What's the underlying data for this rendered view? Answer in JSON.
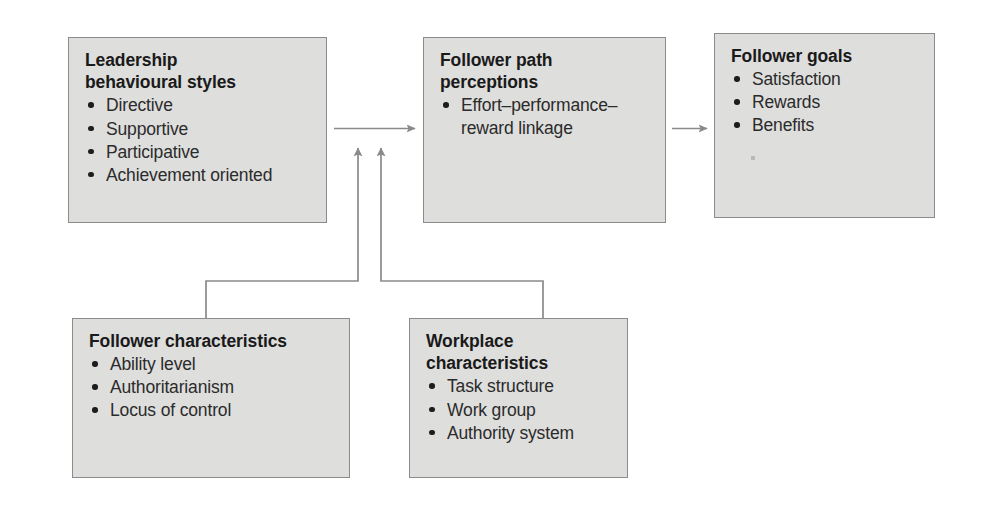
{
  "diagram": {
    "type": "flow-diagram",
    "colors": {
      "box_fill": "#dededd",
      "box_border": "#8b8b8b",
      "connector": "#8a8a8a",
      "text": "#1a1a1a",
      "background": "#ffffff"
    },
    "boxes": [
      {
        "id": "leadership-behavioural-styles",
        "title": "Leadership\nbehavioural styles",
        "bullets": [
          "Directive",
          "Supportive",
          "Participative",
          "Achievement oriented"
        ]
      },
      {
        "id": "follower-path-perceptions",
        "title": "Follower path\nperceptions",
        "bullets": [
          "Effort–performance–reward linkage"
        ]
      },
      {
        "id": "follower-goals",
        "title": "Follower goals",
        "bullets": [
          "Satisfaction",
          "Rewards",
          "Benefits"
        ]
      },
      {
        "id": "follower-characteristics",
        "title": "Follower characteristics",
        "bullets": [
          "Ability level",
          "Authoritarianism",
          "Locus of control"
        ]
      },
      {
        "id": "workplace-characteristics",
        "title": "Workplace\ncharacteristics",
        "bullets": [
          "Task structure",
          "Work group",
          "Authority system"
        ]
      }
    ],
    "connectors": [
      {
        "id": "styles-to-perceptions",
        "from": "leadership-behavioural-styles",
        "to": "follower-path-perceptions",
        "style": "arrow-right"
      },
      {
        "id": "perceptions-to-goals",
        "from": "follower-path-perceptions",
        "to": "follower-goals",
        "style": "arrow-right"
      },
      {
        "id": "follower-characteristics-to-styles",
        "from": "follower-characteristics",
        "to": "leadership-behavioural-styles",
        "style": "elbow-arrow-up"
      },
      {
        "id": "workplace-characteristics-to-styles",
        "from": "workplace-characteristics",
        "to": "leadership-behavioural-styles",
        "style": "elbow-arrow-up"
      }
    ]
  }
}
